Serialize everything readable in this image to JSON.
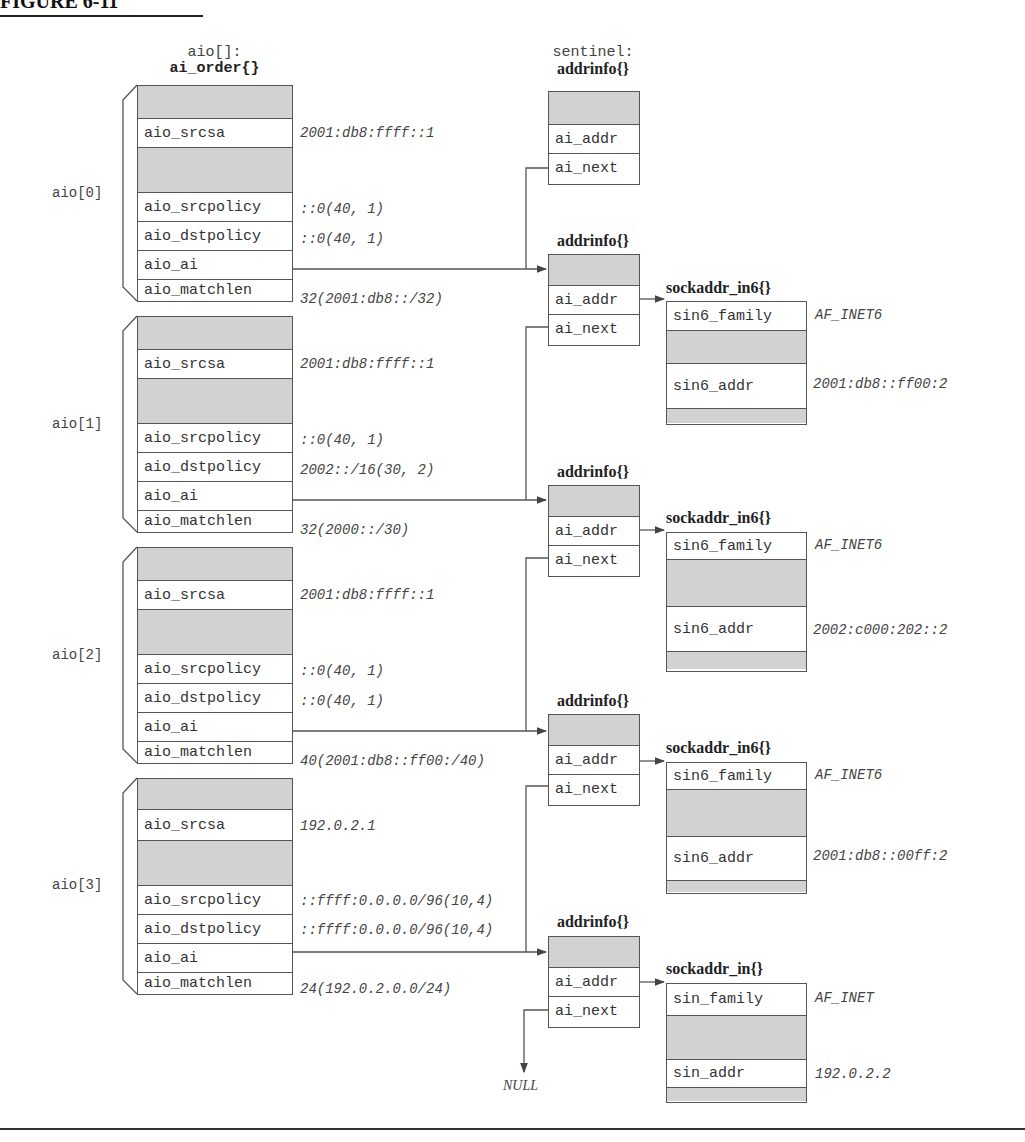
{
  "header": {
    "figure_label": "FIGURE 6-11"
  },
  "aio_array": {
    "title_line1": "aio[]:",
    "title_line2": "ai_order{}",
    "entries": [
      {
        "label": "aio[0]",
        "fields": {
          "srcsa": "aio_srcsa",
          "srcpolicy": "aio_srcpolicy",
          "dstpolicy": "aio_dstpolicy",
          "ai": "aio_ai",
          "matchlen": "aio_matchlen"
        },
        "values": {
          "srcsa": "2001:db8:ffff::1",
          "srcpolicy": "::0(40, 1)",
          "dstpolicy": "::0(40, 1)",
          "matchlen": "32(2001:db8::/32)"
        }
      },
      {
        "label": "aio[1]",
        "fields": {
          "srcsa": "aio_srcsa",
          "srcpolicy": "aio_srcpolicy",
          "dstpolicy": "aio_dstpolicy",
          "ai": "aio_ai",
          "matchlen": "aio_matchlen"
        },
        "values": {
          "srcsa": "2001:db8:ffff::1",
          "srcpolicy": "::0(40, 1)",
          "dstpolicy": "2002::/16(30, 2)",
          "matchlen": "32(2000::/30)"
        }
      },
      {
        "label": "aio[2]",
        "fields": {
          "srcsa": "aio_srcsa",
          "srcpolicy": "aio_srcpolicy",
          "dstpolicy": "aio_dstpolicy",
          "ai": "aio_ai",
          "matchlen": "aio_matchlen"
        },
        "values": {
          "srcsa": "2001:db8:ffff::1",
          "srcpolicy": "::0(40, 1)",
          "dstpolicy": "::0(40, 1)",
          "matchlen": "40(2001:db8::ff00:/40)"
        }
      },
      {
        "label": "aio[3]",
        "fields": {
          "srcsa": "aio_srcsa",
          "srcpolicy": "aio_srcpolicy",
          "dstpolicy": "aio_dstpolicy",
          "ai": "aio_ai",
          "matchlen": "aio_matchlen"
        },
        "values": {
          "srcsa": "192.0.2.1",
          "srcpolicy": "::ffff:0.0.0.0/96(10,4)",
          "dstpolicy": "::ffff:0.0.0.0/96(10,4)",
          "matchlen": "24(192.0.2.0.0/24)"
        }
      }
    ]
  },
  "sentinel": {
    "title_line1": "sentinel:",
    "title_line2": "addrinfo{}",
    "fields": {
      "addr": "ai_addr",
      "next": "ai_next"
    }
  },
  "addrinfos": [
    {
      "title": "addrinfo{}",
      "fields": {
        "addr": "ai_addr",
        "next": "ai_next"
      }
    },
    {
      "title": "addrinfo{}",
      "fields": {
        "addr": "ai_addr",
        "next": "ai_next"
      }
    },
    {
      "title": "addrinfo{}",
      "fields": {
        "addr": "ai_addr",
        "next": "ai_next"
      }
    },
    {
      "title": "addrinfo{}",
      "fields": {
        "addr": "ai_addr",
        "next": "ai_next"
      }
    }
  ],
  "sockaddrs": [
    {
      "title": "sockaddr_in6{}",
      "family_field": "sin6_family",
      "family_value": "AF_INET6",
      "addr_field": "sin6_addr",
      "addr_value": "2001:db8::ff00:2"
    },
    {
      "title": "sockaddr_in6{}",
      "family_field": "sin6_family",
      "family_value": "AF_INET6",
      "addr_field": "sin6_addr",
      "addr_value": "2002:c000:202::2"
    },
    {
      "title": "sockaddr_in6{}",
      "family_field": "sin6_family",
      "family_value": "AF_INET6",
      "addr_field": "sin6_addr",
      "addr_value": "2001:db8::00ff:2"
    },
    {
      "title": "sockaddr_in{}",
      "family_field": "sin_family",
      "family_value": "AF_INET",
      "addr_field": "sin_addr",
      "addr_value": "192.0.2.2"
    }
  ],
  "null_label": "NULL"
}
